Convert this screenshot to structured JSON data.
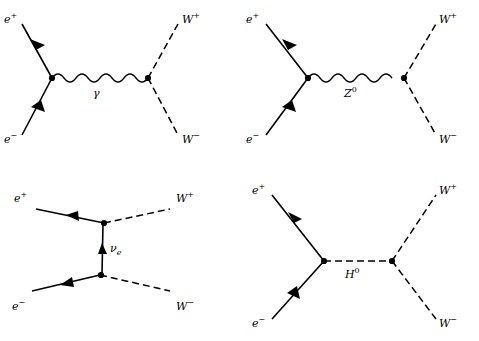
{
  "figure": {
    "line_color": "#000000",
    "vertex_color": "#000000"
  },
  "diagrams": [
    {
      "id": "photon-exchange",
      "name": "s-channel photon exchange",
      "propagator_style": "wavy",
      "labels": {
        "in_top": "e",
        "in_top_sup": "+",
        "in_bottom": "e",
        "in_bottom_sup": "−",
        "out_top": "W",
        "out_top_sup": "+",
        "out_bottom": "W",
        "out_bottom_sup": "−",
        "propagator": "γ",
        "propagator_sup": ""
      }
    },
    {
      "id": "z-boson-exchange",
      "name": "s-channel Z boson exchange",
      "propagator_style": "wavy",
      "labels": {
        "in_top": "e",
        "in_top_sup": "+",
        "in_bottom": "e",
        "in_bottom_sup": "−",
        "out_top": "W",
        "out_top_sup": "+",
        "out_bottom": "W",
        "out_bottom_sup": "−",
        "propagator": "Z",
        "propagator_sup": "0"
      }
    },
    {
      "id": "neutrino-exchange",
      "name": "t-channel neutrino exchange",
      "propagator_style": "straight-arrow-up",
      "labels": {
        "in_top": "e",
        "in_top_sup": "+",
        "in_bottom": "e",
        "in_bottom_sup": "−",
        "out_top": "W",
        "out_top_sup": "+",
        "out_bottom": "W",
        "out_bottom_sup": "−",
        "propagator": "ν",
        "propagator_sub": "e"
      }
    },
    {
      "id": "higgs-exchange",
      "name": "s-channel Higgs boson exchange",
      "propagator_style": "dashed",
      "labels": {
        "in_top": "e",
        "in_top_sup": "+",
        "in_bottom": "e",
        "in_bottom_sup": "−",
        "out_top": "W",
        "out_top_sup": "+",
        "out_bottom": "W",
        "out_bottom_sup": "−",
        "propagator": "H",
        "propagator_sup": "0"
      }
    }
  ]
}
